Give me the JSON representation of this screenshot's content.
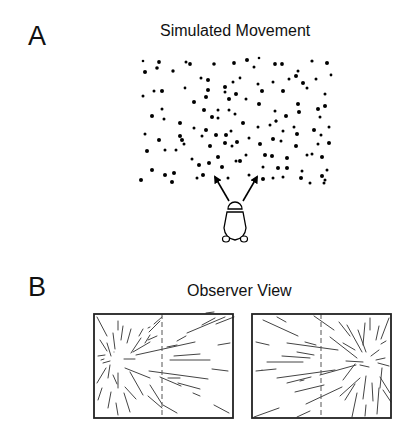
{
  "panel_a": {
    "letter": "A",
    "title": "Simulated Movement",
    "dot_color": "#000000",
    "dots": [
      [
        143,
        61,
        1.3
      ],
      [
        159,
        62,
        1.9
      ],
      [
        145,
        72,
        2
      ],
      [
        157,
        68,
        1.8
      ],
      [
        173,
        71,
        1.7
      ],
      [
        186,
        62,
        1.5
      ],
      [
        190,
        64,
        1.9
      ],
      [
        214,
        64,
        1.8
      ],
      [
        234,
        63,
        1.9
      ],
      [
        247,
        60,
        2
      ],
      [
        254,
        67,
        1.5
      ],
      [
        259,
        58,
        1.3
      ],
      [
        275,
        64,
        1.9
      ],
      [
        282,
        64,
        1.9
      ],
      [
        298,
        71,
        1.5
      ],
      [
        312,
        61,
        1.6
      ],
      [
        327,
        63,
        2
      ],
      [
        331,
        75,
        1.4
      ],
      [
        201,
        78,
        1.5
      ],
      [
        208,
        80,
        2
      ],
      [
        225,
        87,
        2
      ],
      [
        233,
        82,
        1.5
      ],
      [
        240,
        78,
        1.4
      ],
      [
        258,
        84,
        1.5
      ],
      [
        273,
        82,
        1.5
      ],
      [
        289,
        79,
        1.5
      ],
      [
        296,
        76,
        2
      ],
      [
        303,
        83,
        2
      ],
      [
        316,
        79,
        1.5
      ],
      [
        307,
        88,
        1.5
      ],
      [
        143,
        96,
        1.5
      ],
      [
        154,
        91,
        1.5
      ],
      [
        162,
        91,
        2
      ],
      [
        185,
        88,
        1.4
      ],
      [
        208,
        90,
        2
      ],
      [
        225,
        92,
        1.5
      ],
      [
        236,
        94,
        2
      ],
      [
        262,
        91,
        2
      ],
      [
        283,
        91,
        2
      ],
      [
        325,
        94,
        1.5
      ],
      [
        194,
        102,
        2
      ],
      [
        206,
        97,
        2
      ],
      [
        229,
        99,
        2
      ],
      [
        246,
        99,
        1.5
      ],
      [
        259,
        104,
        2
      ],
      [
        298,
        104,
        2
      ],
      [
        299,
        112,
        2
      ],
      [
        318,
        109,
        2
      ],
      [
        325,
        106,
        2
      ],
      [
        152,
        116,
        2
      ],
      [
        162,
        109,
        1.5
      ],
      [
        164,
        119,
        1.5
      ],
      [
        180,
        123,
        2
      ],
      [
        204,
        110,
        2
      ],
      [
        218,
        110,
        1.5
      ],
      [
        229,
        110,
        1.5
      ],
      [
        235,
        114,
        1.5
      ],
      [
        218,
        118,
        1.5
      ],
      [
        212,
        117,
        2
      ],
      [
        243,
        123,
        2
      ],
      [
        275,
        111,
        1.5
      ],
      [
        276,
        121,
        1.5
      ],
      [
        286,
        116,
        2
      ],
      [
        320,
        117,
        1.5
      ],
      [
        145,
        134,
        1.5
      ],
      [
        159,
        140,
        2
      ],
      [
        180,
        136,
        2
      ],
      [
        194,
        128,
        1.5
      ],
      [
        206,
        130,
        2
      ],
      [
        202,
        136,
        1.5
      ],
      [
        216,
        135,
        2
      ],
      [
        226,
        135,
        2
      ],
      [
        231,
        131,
        1.5
      ],
      [
        249,
        138,
        1.5
      ],
      [
        258,
        127,
        1.5
      ],
      [
        270,
        125,
        1.5
      ],
      [
        276,
        121,
        1.5
      ],
      [
        283,
        131,
        1.5
      ],
      [
        294,
        127,
        1.5
      ],
      [
        297,
        134,
        2
      ],
      [
        314,
        130,
        2
      ],
      [
        321,
        135,
        1.5
      ],
      [
        329,
        127,
        1.5
      ],
      [
        147,
        151,
        2
      ],
      [
        165,
        150,
        1.5
      ],
      [
        176,
        150,
        1.5
      ],
      [
        182,
        140,
        2
      ],
      [
        184,
        144,
        1.5
      ],
      [
        210,
        146,
        2
      ],
      [
        225,
        143,
        2
      ],
      [
        232,
        146,
        1.5
      ],
      [
        237,
        142,
        2
      ],
      [
        260,
        144,
        2
      ],
      [
        273,
        139,
        2
      ],
      [
        281,
        141,
        1.5
      ],
      [
        296,
        146,
        2
      ],
      [
        318,
        144,
        1.5
      ],
      [
        329,
        143,
        2
      ],
      [
        192,
        159,
        1.5
      ],
      [
        218,
        157,
        2
      ],
      [
        236,
        161,
        1.5
      ],
      [
        246,
        155,
        1.5
      ],
      [
        265,
        155,
        2
      ],
      [
        272,
        156,
        2
      ],
      [
        287,
        158,
        2
      ],
      [
        307,
        155,
        1.5
      ],
      [
        312,
        154,
        1.5
      ],
      [
        322,
        157,
        2
      ],
      [
        152,
        170,
        2
      ],
      [
        165,
        175,
        2
      ],
      [
        174,
        173,
        2
      ],
      [
        199,
        165,
        2
      ],
      [
        209,
        163,
        2
      ],
      [
        222,
        167,
        2
      ],
      [
        240,
        161,
        2
      ],
      [
        263,
        167,
        1.5
      ],
      [
        278,
        168,
        2
      ],
      [
        287,
        168,
        2
      ],
      [
        302,
        171,
        1.5
      ],
      [
        327,
        170,
        1.5
      ],
      [
        141,
        180,
        2
      ],
      [
        172,
        182,
        2
      ],
      [
        197,
        178,
        1.5
      ],
      [
        203,
        175,
        2
      ],
      [
        228,
        178,
        1.5
      ],
      [
        249,
        175,
        1.5
      ],
      [
        263,
        179,
        2
      ],
      [
        273,
        178,
        1.5
      ],
      [
        283,
        177,
        1.5
      ],
      [
        301,
        178,
        2
      ],
      [
        310,
        183,
        1.5
      ],
      [
        322,
        176,
        2
      ],
      [
        325,
        180,
        1.5
      ],
      [
        324,
        183,
        1.5
      ]
    ],
    "arrows": [
      {
        "from": [
          229,
          201
        ],
        "to": [
          215,
          177
        ]
      },
      {
        "from": [
          243,
          201
        ],
        "to": [
          257,
          177
        ]
      }
    ],
    "observer": "observer-figure"
  },
  "panel_b": {
    "letter": "B",
    "title": "Observer View",
    "views": [
      {
        "name": "left-view",
        "focus": [
          117,
          360
        ],
        "lines": [
          [
            97,
            317,
            107,
            336
          ],
          [
            118,
            321,
            118,
            330
          ],
          [
            123,
            326,
            121,
            340
          ],
          [
            131,
            329,
            127,
            343
          ],
          [
            143,
            329,
            139,
            336
          ],
          [
            141,
            338,
            131,
            353
          ],
          [
            148,
            328,
            150,
            327
          ],
          [
            150,
            335,
            145,
            343
          ],
          [
            154,
            324,
            162,
            317
          ],
          [
            160,
            321,
            149,
            332
          ],
          [
            100,
            340,
            107,
            351
          ],
          [
            107,
            343,
            111,
            356
          ],
          [
            113,
            333,
            115,
            349
          ],
          [
            114,
            352,
            114,
            352
          ],
          [
            133,
            352,
            150,
            342
          ],
          [
            148,
            340,
            157,
            336
          ],
          [
            98,
            356,
            105,
            355
          ],
          [
            103,
            363,
            110,
            361
          ],
          [
            101,
            360,
            104,
            359
          ],
          [
            124,
            359,
            135,
            359
          ],
          [
            136,
            355,
            195,
            342
          ],
          [
            167,
            347,
            177,
            345
          ],
          [
            177,
            341,
            186,
            336
          ],
          [
            202,
            325,
            215,
            318
          ],
          [
            187,
            333,
            225,
            317
          ],
          [
            206,
            313,
            214,
            312
          ],
          [
            216,
            324,
            234,
            317
          ],
          [
            218,
            345,
            230,
            343
          ],
          [
            125,
            368,
            150,
            378
          ],
          [
            149,
            371,
            208,
            379
          ],
          [
            168,
            378,
            180,
            378
          ],
          [
            170,
            360,
            210,
            360
          ],
          [
            174,
            356,
            200,
            354
          ],
          [
            212,
            369,
            228,
            371
          ],
          [
            97,
            383,
            106,
            368
          ],
          [
            108,
            378,
            110,
            365
          ],
          [
            113,
            375,
            117,
            384
          ],
          [
            118,
            373,
            118,
            388
          ],
          [
            125,
            387,
            136,
            399
          ],
          [
            130,
            372,
            143,
            395
          ],
          [
            150,
            385,
            162,
            404
          ],
          [
            160,
            377,
            181,
            386
          ],
          [
            98,
            400,
            102,
            388
          ],
          [
            108,
            408,
            111,
            392
          ],
          [
            118,
            415,
            116,
            403
          ],
          [
            124,
            393,
            130,
            412
          ],
          [
            148,
            396,
            162,
            408
          ],
          [
            163,
            405,
            177,
            413
          ],
          [
            178,
            383,
            200,
            389
          ],
          [
            193,
            393,
            200,
            396
          ],
          [
            214,
            405,
            229,
            413
          ]
        ],
        "divider_x": 162
      },
      {
        "name": "right-view",
        "focus": [
          370,
          362
        ],
        "lines": [
          [
            263,
            320,
            298,
            336
          ],
          [
            277,
            317,
            286,
            322
          ],
          [
            314,
            316,
            334,
            330
          ],
          [
            339,
            322,
            350,
            336
          ],
          [
            370,
            318,
            370,
            330
          ],
          [
            365,
            323,
            363,
            345
          ],
          [
            379,
            326,
            376,
            340
          ],
          [
            389,
            318,
            381,
            339
          ],
          [
            256,
            342,
            269,
            345
          ],
          [
            287,
            343,
            338,
            350
          ],
          [
            305,
            342,
            316,
            345
          ],
          [
            330,
            337,
            357,
            358
          ],
          [
            343,
            343,
            355,
            350
          ],
          [
            358,
            330,
            366,
            352
          ],
          [
            347,
            325,
            362,
            352
          ],
          [
            381,
            344,
            386,
            341
          ],
          [
            267,
            362,
            303,
            362
          ],
          [
            282,
            356,
            310,
            358
          ],
          [
            297,
            352,
            314,
            355
          ],
          [
            346,
            361,
            363,
            362
          ],
          [
            360,
            365,
            369,
            367
          ],
          [
            378,
            363,
            389,
            366
          ],
          [
            371,
            356,
            379,
            350
          ],
          [
            385,
            358,
            376,
            360
          ],
          [
            256,
            371,
            276,
            369
          ],
          [
            277,
            378,
            335,
            370
          ],
          [
            320,
            375,
            356,
            365
          ],
          [
            262,
            370,
            262,
            370
          ],
          [
            287,
            383,
            311,
            377
          ],
          [
            304,
            380,
            300,
            381
          ],
          [
            295,
            392,
            324,
            385
          ],
          [
            306,
            404,
            342,
            387
          ],
          [
            343,
            380,
            355,
            364
          ],
          [
            340,
            396,
            360,
            378
          ],
          [
            345,
            400,
            355,
            384
          ],
          [
            363,
            399,
            366,
            376
          ],
          [
            373,
            401,
            372,
            383
          ],
          [
            380,
            388,
            382,
            368
          ],
          [
            380,
            377,
            390,
            393
          ],
          [
            383,
            390,
            391,
            402
          ],
          [
            254,
            417,
            279,
            408
          ],
          [
            297,
            417,
            310,
            411
          ],
          [
            352,
            417,
            357,
            393
          ],
          [
            365,
            416,
            366,
            405
          ],
          [
            377,
            414,
            379,
            388
          ]
        ],
        "divider_x": 321
      }
    ],
    "line_color": "#444444",
    "frame_color": "#222222"
  }
}
